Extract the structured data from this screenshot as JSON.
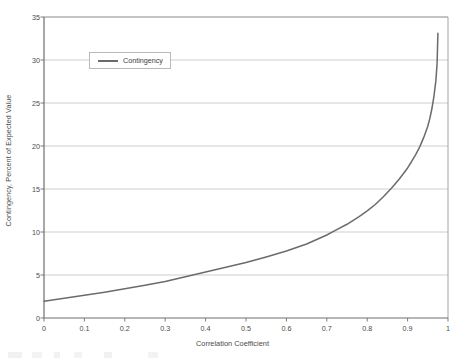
{
  "chart_data": {
    "type": "line",
    "title": "",
    "subtitle": "",
    "xlabel": "Correlation Coefficient",
    "ylabel": "Contingency, Percent of Expected Value",
    "xlim": [
      0,
      1
    ],
    "ylim": [
      0,
      35
    ],
    "xticks": [
      "0",
      "0.1",
      "0.2",
      "0.3",
      "0.4",
      "0.5",
      "0.6",
      "0.7",
      "0.8",
      "0.9",
      "1"
    ],
    "xtick_values": [
      0,
      0.1,
      0.2,
      0.3,
      0.4,
      0.5,
      0.6,
      0.7,
      0.8,
      0.9,
      1
    ],
    "yticks": [
      "0",
      "5",
      "10",
      "15",
      "20",
      "25",
      "30",
      "35"
    ],
    "ytick_values": [
      0,
      5,
      10,
      15,
      20,
      25,
      30,
      35
    ],
    "grid": "horizontal",
    "legend_position": "upper-left-inside",
    "legend_entries": [
      "Contingency"
    ],
    "series": [
      {
        "name": "Contingency",
        "color": "#6b6b6b",
        "x": [
          0.0,
          0.05,
          0.1,
          0.15,
          0.2,
          0.25,
          0.3,
          0.35,
          0.4,
          0.45,
          0.5,
          0.55,
          0.6,
          0.65,
          0.7,
          0.72,
          0.75,
          0.78,
          0.8,
          0.82,
          0.84,
          0.86,
          0.88,
          0.9,
          0.91,
          0.92,
          0.93,
          0.94,
          0.95,
          0.955,
          0.96,
          0.965,
          0.97,
          0.973,
          0.975
        ],
        "values": [
          1.95,
          2.3,
          2.65,
          3.0,
          3.4,
          3.8,
          4.25,
          4.8,
          5.35,
          5.9,
          6.45,
          7.1,
          7.8,
          8.6,
          9.65,
          10.15,
          10.9,
          11.8,
          12.45,
          13.2,
          14.1,
          15.1,
          16.2,
          17.45,
          18.2,
          19.0,
          19.9,
          21.0,
          22.3,
          23.2,
          24.3,
          25.7,
          27.6,
          29.6,
          33.1
        ]
      }
    ]
  },
  "legend": {
    "label": "Contingency"
  },
  "axes": {
    "x_title": "Correlation Coefficient",
    "y_title": "Contingency, Percent of Expected Value"
  }
}
